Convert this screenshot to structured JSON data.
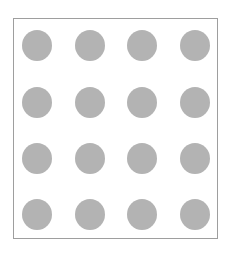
{
  "figure": {
    "type": "dot-grid",
    "rows": 4,
    "columns": 4,
    "dot_color": "#b3b3b3",
    "border_color": "#9e9e9e",
    "background": "#ffffff",
    "dot_centers_x": [
      37,
      90,
      142,
      195
    ],
    "dot_centers_y": [
      45,
      102,
      158,
      214
    ],
    "dot_diameter": 30
  }
}
